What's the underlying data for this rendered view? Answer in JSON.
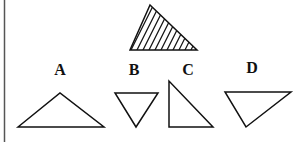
{
  "puzzle": {
    "reference_shape": "hatched-triangle",
    "options": [
      {
        "label": "A"
      },
      {
        "label": "B"
      },
      {
        "label": "C"
      },
      {
        "label": "D"
      }
    ]
  },
  "colors": {
    "stroke": "#111111",
    "background": "#ffffff",
    "border": "#555555"
  }
}
